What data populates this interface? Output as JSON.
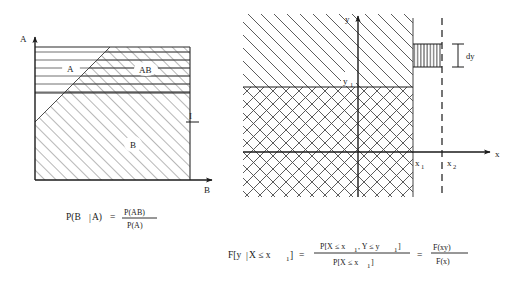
{
  "figure": {
    "title_visible": false,
    "panels": [
      {
        "id": "left-panel",
        "name": "conditional-probability-venn-rectangle",
        "axes": {
          "vertical_label": "A",
          "horizontal_label": "B"
        },
        "regions": [
          {
            "label": "A",
            "hatch": "horizontal"
          },
          {
            "label": "AB",
            "hatch": "horizontal-and-diagonal"
          },
          {
            "label": "B",
            "hatch": "diagonal"
          }
        ],
        "annotations": [
          {
            "label": "I",
            "name": "region-I-marker"
          }
        ],
        "formula": {
          "lhs": "P(B",
          "lhs_bar": "|",
          "lhs_tail": "A)",
          "equals": "=",
          "numerator": "P(AB)",
          "denominator": "P(A)"
        }
      },
      {
        "id": "right-panel",
        "name": "joint-cdf-coordinate-plane",
        "axes": {
          "vertical_label": "y",
          "horizontal_label": "x"
        },
        "tick_labels": [
          {
            "base": "x",
            "sub": "1",
            "name": "x1-tick-label"
          },
          {
            "base": "x",
            "sub": "2",
            "name": "x2-tick-label"
          },
          {
            "base": "y",
            "sub": "1",
            "name": "y1-tick-label"
          }
        ],
        "annotations": [
          {
            "label": "dy",
            "name": "dy-annotation"
          }
        ],
        "hatching": {
          "upper_region": "single-diagonal",
          "lower_region": "crosshatch",
          "dy_strip": "vertical"
        },
        "formula": {
          "lhs_a": "F[y",
          "lhs_bar": "|",
          "lhs_b": "X ≤ x",
          "lhs_sub": "1",
          "lhs_c": "]",
          "equals1": "=",
          "numerator_a": "P[X ≤ x",
          "numerator_sub1": "1",
          "numerator_b": ", Y ≤ y",
          "numerator_sub2": "1",
          "numerator_c": "]",
          "denominator_a": "P[X ≤ x",
          "denominator_sub": "1",
          "denominator_b": "]",
          "equals2": "=",
          "final_numerator": "F(xy)",
          "final_denominator": "F(x)"
        }
      }
    ]
  },
  "colors": {
    "ink": "#1a1a1a",
    "hatch": "#555555",
    "background": "#ffffff"
  }
}
